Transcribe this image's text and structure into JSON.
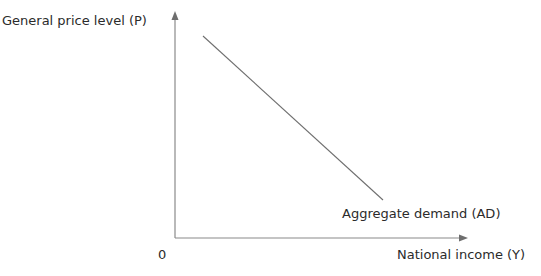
{
  "diagram": {
    "title": "",
    "y_axis_label": "General price level (P)",
    "x_axis_label": "National income (Y)",
    "origin_label": "0",
    "curves": [
      {
        "name": "Aggregate demand (AD)",
        "label": "Aggregate demand (AD)",
        "type": "line",
        "slope": "downward",
        "start": {
          "x": 203,
          "y": 36
        },
        "end": {
          "x": 383,
          "y": 200
        },
        "color": "#6e6e6e"
      }
    ],
    "axis_color": "#8a8a8a",
    "origin_px": {
      "x": 175,
      "y": 238
    },
    "y_axis_top_px": 12,
    "x_axis_right_px": 467
  }
}
